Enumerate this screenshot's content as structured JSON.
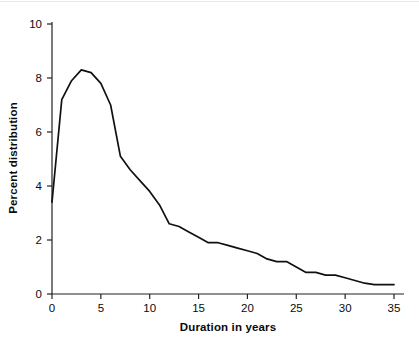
{
  "chart_data": {
    "type": "line",
    "title": "",
    "subtitle": "",
    "xlabel": "Duration in years",
    "ylabel": "Percent distribution",
    "xlim": [
      0,
      35
    ],
    "ylim": [
      0,
      10
    ],
    "xticks": [
      "0",
      "5",
      "10",
      "15",
      "20",
      "25",
      "30",
      "35"
    ],
    "xtick_values": [
      0,
      5,
      10,
      15,
      20,
      25,
      30,
      35
    ],
    "yticks": [
      "0",
      "2",
      "4",
      "6",
      "8",
      "10"
    ],
    "ytick_values": [
      0,
      2,
      4,
      6,
      8,
      10
    ],
    "grid": false,
    "legend": null,
    "line_color": "#111111",
    "axis_color": "#222222",
    "background_color": "#ffffff",
    "series": [
      {
        "name": "Percent distribution by duration",
        "x": [
          0,
          1,
          2,
          3,
          4,
          5,
          6,
          7,
          8,
          9,
          10,
          11,
          12,
          13,
          14,
          15,
          16,
          17,
          18,
          19,
          20,
          21,
          22,
          23,
          24,
          25,
          26,
          27,
          28,
          29,
          30,
          31,
          32,
          33,
          34,
          35
        ],
        "values": [
          3.4,
          7.2,
          7.9,
          8.3,
          8.2,
          7.8,
          7.0,
          5.1,
          4.6,
          4.2,
          3.8,
          3.3,
          2.6,
          2.5,
          2.3,
          2.1,
          1.9,
          1.9,
          1.8,
          1.7,
          1.6,
          1.5,
          1.3,
          1.2,
          1.2,
          1.0,
          0.8,
          0.8,
          0.7,
          0.7,
          0.6,
          0.5,
          0.4,
          0.35,
          0.35,
          0.35
        ]
      }
    ]
  },
  "axis_titles": {
    "x": "Duration in years",
    "y": "Percent distribution"
  }
}
